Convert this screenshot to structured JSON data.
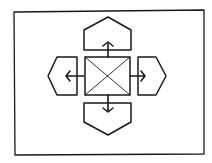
{
  "diagram": {
    "title": "",
    "stroke_color": "#1a1a1a",
    "background": "#ffffff",
    "elements": {
      "frame": {
        "x": 14,
        "y": 11,
        "w": 190,
        "h": 144
      },
      "center_box": {
        "x": 84,
        "y": 57,
        "w": 46,
        "h": 38,
        "type": "image-placeholder"
      },
      "panels": [
        {
          "direction": "up"
        },
        {
          "direction": "down"
        },
        {
          "direction": "left"
        },
        {
          "direction": "right"
        }
      ]
    }
  }
}
